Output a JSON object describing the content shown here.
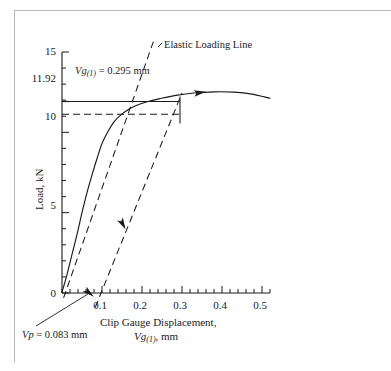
{
  "figure": {
    "border_color": "#b9b9b9",
    "background": "#ffffff",
    "line_color": "#1a1a1a"
  },
  "chart_data": {
    "type": "line",
    "title": "",
    "xlabel_line1": "Clip Gauge Displacement,",
    "xlabel_line2_prefix": "Vg",
    "xlabel_line2_sub": "(1)",
    "xlabel_line2_suffix": ", mm",
    "ylabel": "Load, kN",
    "xlim": [
      0,
      0.54
    ],
    "ylim": [
      0,
      15
    ],
    "grid": false,
    "legend": "none",
    "x_ticks_major": [
      0.1,
      0.2,
      0.3,
      0.4,
      0.5
    ],
    "x_tick_labels": [
      "0.1",
      "0.2",
      "0.3",
      "0.4",
      "0.5"
    ],
    "x_minor_step": 0.02,
    "y_ticks_major": [
      0,
      5,
      10,
      15
    ],
    "y_tick_labels": [
      "0",
      "5",
      "10",
      "15"
    ],
    "y_special_tick": 11.92,
    "y_special_label": "11.92",
    "y_minor_step": 1,
    "series": [
      {
        "name": "Load-displacement record",
        "style": "solid",
        "points": [
          [
            0.0,
            0.05
          ],
          [
            0.012,
            1.1
          ],
          [
            0.025,
            2.4
          ],
          [
            0.038,
            3.7
          ],
          [
            0.05,
            5.0
          ],
          [
            0.062,
            6.2
          ],
          [
            0.075,
            7.35
          ],
          [
            0.088,
            8.4
          ],
          [
            0.1,
            9.3
          ],
          [
            0.115,
            10.05
          ],
          [
            0.13,
            10.65
          ],
          [
            0.148,
            11.1
          ],
          [
            0.168,
            11.45
          ],
          [
            0.19,
            11.72
          ],
          [
            0.215,
            11.92
          ],
          [
            0.245,
            12.1
          ],
          [
            0.285,
            12.3
          ],
          [
            0.33,
            12.45
          ],
          [
            0.38,
            12.52
          ],
          [
            0.43,
            12.5
          ],
          [
            0.475,
            12.38
          ],
          [
            0.52,
            12.12
          ]
        ]
      },
      {
        "name": "Elastic Loading Line",
        "style": "dashed",
        "points": [
          [
            0.004,
            -0.3
          ],
          [
            0.232,
            15.9
          ]
        ]
      },
      {
        "name": "Offset unloading compliance line",
        "style": "dashed",
        "points": [
          [
            0.083,
            -0.9
          ],
          [
            0.3,
            12.45
          ]
        ]
      }
    ],
    "annotations": [
      {
        "name": "elastic-loading-line-label",
        "text": "Elastic Loading Line",
        "x": 0.265,
        "y": 15.4
      },
      {
        "name": "vg1-label",
        "text_prefix": "Vg",
        "text_sub": "(1)",
        "text_suffix": " = 0.295 mm",
        "x": 0.048,
        "y": 13.3
      },
      {
        "name": "vp-label",
        "text_prefix": "Vp",
        "text_suffix": " = 0.083 mm",
        "x": 0.012,
        "y": -2.6
      }
    ],
    "measure_line": {
      "name": "vg1-measure",
      "y": 11.92,
      "x_start": 0.0,
      "x_end": 0.295,
      "style": "solid-with-end-tick"
    },
    "dashed_level_line": {
      "name": "load-level-guide",
      "y": 11.12,
      "x_start": 0.0,
      "x_end": 0.295,
      "style": "dashed"
    },
    "arrow_markers": [
      {
        "name": "curve-direction-arrow",
        "x": 0.345,
        "y": 12.47,
        "angle_deg": -8
      },
      {
        "name": "offset-line-direction-arrow",
        "x": 0.152,
        "y": 4.28,
        "angle_deg": 62
      },
      {
        "name": "vp-pointer-arrow",
        "x": 0.068,
        "y": 0.0,
        "angle_deg": 40
      }
    ]
  }
}
